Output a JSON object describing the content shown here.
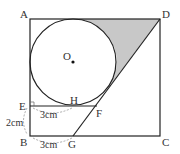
{
  "diagram": {
    "points": {
      "A": {
        "label": "A",
        "x": 30,
        "y": 19
      },
      "B": {
        "label": "B",
        "x": 30,
        "y": 136
      },
      "C": {
        "label": "C",
        "x": 160,
        "y": 136
      },
      "D": {
        "label": "D",
        "x": 160,
        "y": 19
      },
      "E": {
        "label": "E",
        "x": 30,
        "y": 106
      },
      "F": {
        "label": "F",
        "x": 97,
        "y": 106
      },
      "G": {
        "label": "G",
        "x": 73,
        "y": 136
      },
      "H": {
        "label": "H",
        "x": 73,
        "y": 106
      },
      "O": {
        "label": "O",
        "x": 73,
        "y": 62
      }
    },
    "circle": {
      "cx": 73,
      "cy": 62,
      "r": 43
    },
    "measurements": {
      "EH": "3cm",
      "EB": "2cm",
      "BG": "3cm"
    },
    "colors": {
      "line": "#222222",
      "shade": "#c8c8c8",
      "dashed": "#888888"
    }
  }
}
